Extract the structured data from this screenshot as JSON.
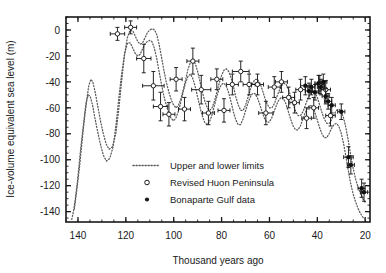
{
  "chart_data": {
    "type": "scatter",
    "title": "",
    "xlabel": "Thousand years ago",
    "ylabel": "Ice-volume equivalent sea level (m)",
    "xlim": [
      145,
      18
    ],
    "ylim": [
      -148,
      10
    ],
    "x_ticks": [
      140,
      120,
      100,
      80,
      60,
      40,
      20
    ],
    "x_tick_labels": [
      "140",
      "120",
      "100",
      "80",
      "60",
      "40",
      "20"
    ],
    "x_minor_step": 5,
    "y_ticks": [
      0,
      -20,
      -40,
      -60,
      -80,
      -100,
      -120,
      -140
    ],
    "y_tick_labels": [
      "0",
      "-20",
      "-40",
      "-60",
      "-80",
      "-100",
      "-120",
      "-140"
    ],
    "y_minor_step": 5,
    "grid": false,
    "axis_direction": "x-reversed",
    "legend_position": "lower-center",
    "legend": [
      {
        "marker": "dotted-line",
        "label": "Upper and lower limits"
      },
      {
        "marker": "open-circle",
        "label": "Revised Huon Peninsula"
      },
      {
        "marker": "filled-circle",
        "label": "Bonaparte Gulf data"
      }
    ],
    "series": [
      {
        "name": "Upper and lower limits",
        "style": "dotted-line",
        "sublines": [
          {
            "name": "upper limit",
            "x": [
              141.5,
              140.8,
              140.0,
              139.2,
              138.5,
              137.8,
              137.0,
              136.2,
              135.5,
              134.6,
              133.8,
              132.8,
              131.8,
              130.6,
              129.4,
              128.2,
              127.0,
              125.6,
              124.2,
              123.0,
              121.8,
              120.6,
              119.4,
              118.2,
              117.0,
              116.0,
              115.0,
              114.0,
              113.0,
              112.0,
              111.0,
              110.0,
              109.0,
              108.0,
              107.0,
              106.0,
              105.0,
              104.0,
              103.0,
              102.0,
              101.0,
              100.0,
              99.0,
              98.0,
              97.0,
              96.0,
              95.0,
              94.0,
              93.0,
              92.0,
              91.0,
              90.0,
              89.0,
              88.0,
              87.0,
              86.0,
              85.0,
              84.0,
              83.0,
              82.0,
              81.0,
              80.0,
              79.0,
              78.0,
              77.0,
              76.0,
              75.0,
              74.0,
              73.0,
              72.0,
              71.0,
              70.0,
              69.0,
              68.0,
              67.0,
              66.0,
              65.0,
              64.0,
              63.0,
              62.0,
              61.0,
              60.0,
              59.0,
              58.0,
              57.0,
              56.0,
              55.0,
              54.0,
              53.0,
              52.0,
              51.0,
              50.0,
              49.0,
              48.0,
              47.0,
              46.0,
              45.0,
              44.0,
              43.0,
              42.0,
              41.0,
              40.0,
              39.0,
              38.0,
              37.0,
              36.0,
              35.0,
              34.0,
              33.0,
              32.0,
              31.0,
              30.0,
              29.0,
              28.0,
              27.0,
              26.0,
              25.0,
              24.0,
              23.0,
              22.0,
              21.0,
              20.0
            ],
            "y": [
              -138,
              -128,
              -116,
              -103,
              -90,
              -77,
              -64,
              -52,
              -43,
              -38,
              -40,
              -48,
              -58,
              -70,
              -80,
              -88,
              -92,
              -90,
              -80,
              -62,
              -40,
              -20,
              -6,
              0,
              -1,
              -5,
              -9,
              -11,
              -10,
              -6,
              -2,
              0,
              1,
              0,
              -4,
              -12,
              -22,
              -32,
              -41,
              -48,
              -54,
              -58,
              -60,
              -58,
              -53,
              -46,
              -38,
              -30,
              -25,
              -23,
              -26,
              -32,
              -40,
              -48,
              -55,
              -60,
              -62,
              -60,
              -55,
              -48,
              -41,
              -35,
              -31,
              -30,
              -32,
              -37,
              -44,
              -52,
              -58,
              -62,
              -62,
              -58,
              -52,
              -46,
              -41,
              -38,
              -38,
              -41,
              -46,
              -52,
              -57,
              -60,
              -60,
              -57,
              -52,
              -47,
              -43,
              -41,
              -42,
              -46,
              -52,
              -58,
              -63,
              -66,
              -66,
              -63,
              -58,
              -53,
              -49,
              -47,
              -48,
              -52,
              -58,
              -64,
              -69,
              -72,
              -72,
              -69,
              -65,
              -62,
              -61,
              -63,
              -68,
              -76,
              -86,
              -97,
              -107,
              -115,
              -121,
              -126,
              -130,
              -133,
              -135
            ]
          },
          {
            "name": "lower limit",
            "x": [
              142.6,
              141.9,
              141.1,
              140.3,
              139.6,
              138.9,
              138.1,
              137.3,
              136.6,
              135.7,
              134.9,
              133.9,
              132.9,
              131.7,
              130.5,
              129.3,
              128.1,
              126.7,
              125.3,
              124.1,
              122.9,
              121.7,
              120.5,
              119.3,
              118.1,
              117.1,
              116.1,
              115.1,
              114.1,
              113.1,
              112.1,
              111.1,
              110.1,
              109.1,
              108.1,
              107.1,
              106.1,
              105.1,
              104.1,
              103.1,
              102.1,
              101.1,
              100.1,
              99.1,
              98.1,
              97.1,
              96.1,
              95.1,
              94.1,
              93.1,
              92.1,
              91.1,
              90.1,
              89.1,
              88.1,
              87.1,
              86.1,
              85.1,
              84.1,
              83.1,
              82.1,
              81.1,
              80.1,
              79.1,
              78.1,
              77.1,
              76.1,
              75.1,
              74.1,
              73.1,
              72.1,
              71.1,
              70.1,
              69.1,
              68.1,
              67.1,
              66.1,
              65.1,
              64.1,
              63.1,
              62.1,
              61.1,
              60.1,
              59.1,
              58.1,
              57.1,
              56.1,
              55.1,
              54.1,
              53.1,
              52.1,
              51.1,
              50.1,
              49.1,
              48.1,
              47.1,
              46.1,
              45.1,
              44.1,
              43.1,
              42.1,
              41.1,
              40.1,
              39.1,
              38.1,
              37.1,
              36.1,
              35.1,
              34.1,
              33.1,
              32.1,
              31.1,
              30.1,
              29.1,
              28.1,
              27.1,
              26.1,
              25.1,
              24.1,
              23.1,
              22.1,
              21.1,
              20.1
            ],
            "y": [
              -146,
              -140,
              -130,
              -118,
              -105,
              -92,
              -79,
              -66,
              -56,
              -50,
              -51,
              -58,
              -68,
              -79,
              -89,
              -97,
              -101,
              -99,
              -90,
              -73,
              -52,
              -33,
              -18,
              -10,
              -10,
              -14,
              -18,
              -20,
              -19,
              -15,
              -11,
              -9,
              -8,
              -9,
              -14,
              -22,
              -32,
              -42,
              -51,
              -58,
              -64,
              -68,
              -70,
              -68,
              -63,
              -56,
              -48,
              -41,
              -36,
              -34,
              -37,
              -43,
              -51,
              -59,
              -66,
              -71,
              -73,
              -71,
              -66,
              -59,
              -52,
              -46,
              -42,
              -41,
              -43,
              -48,
              -55,
              -63,
              -69,
              -73,
              -73,
              -69,
              -63,
              -57,
              -52,
              -49,
              -49,
              -52,
              -57,
              -63,
              -68,
              -71,
              -71,
              -68,
              -63,
              -58,
              -54,
              -52,
              -53,
              -57,
              -63,
              -69,
              -74,
              -77,
              -77,
              -74,
              -69,
              -64,
              -60,
              -58,
              -59,
              -63,
              -69,
              -75,
              -80,
              -83,
              -83,
              -80,
              -76,
              -73,
              -72,
              -74,
              -79,
              -87,
              -97,
              -108,
              -118,
              -126,
              -132,
              -137,
              -141,
              -144,
              -146
            ]
          }
        ]
      },
      {
        "name": "Revised Huon Peninsula",
        "style": "open-circle",
        "points": [
          {
            "x": 123.5,
            "y": -3,
            "xerr": 3.0,
            "yerr": 5
          },
          {
            "x": 118.0,
            "y": 2,
            "xerr": 2.5,
            "yerr": 5
          },
          {
            "x": 112.5,
            "y": -22,
            "xerr": 3.0,
            "yerr": 11
          },
          {
            "x": 108.5,
            "y": -43,
            "xerr": 4.5,
            "yerr": 11
          },
          {
            "x": 105.5,
            "y": -59,
            "xerr": 3.0,
            "yerr": 11
          },
          {
            "x": 102.0,
            "y": -65,
            "xerr": 2.5,
            "yerr": 9
          },
          {
            "x": 99.0,
            "y": -38,
            "xerr": 2.5,
            "yerr": 9
          },
          {
            "x": 95.5,
            "y": -61,
            "xerr": 2.5,
            "yerr": 9
          },
          {
            "x": 92.0,
            "y": -24,
            "xerr": 2.5,
            "yerr": 10
          },
          {
            "x": 88.5,
            "y": -46,
            "xerr": 4.0,
            "yerr": 11
          },
          {
            "x": 85.5,
            "y": -64,
            "xerr": 2.5,
            "yerr": 9
          },
          {
            "x": 82.0,
            "y": -38,
            "xerr": 2.5,
            "yerr": 8
          },
          {
            "x": 79.0,
            "y": -62,
            "xerr": 2.5,
            "yerr": 9
          },
          {
            "x": 75.5,
            "y": -42,
            "xerr": 2.5,
            "yerr": 8
          },
          {
            "x": 72.0,
            "y": -32,
            "xerr": 3.5,
            "yerr": 8
          },
          {
            "x": 68.5,
            "y": -42,
            "xerr": 2.5,
            "yerr": 8
          },
          {
            "x": 65.0,
            "y": -42,
            "xerr": 2.5,
            "yerr": 8
          },
          {
            "x": 61.5,
            "y": -64,
            "xerr": 3.0,
            "yerr": 9
          },
          {
            "x": 58.0,
            "y": -44,
            "xerr": 2.5,
            "yerr": 8
          },
          {
            "x": 55.0,
            "y": -40,
            "xerr": 2.5,
            "yerr": 8
          },
          {
            "x": 52.0,
            "y": -52,
            "xerr": 2.5,
            "yerr": 8
          },
          {
            "x": 49.5,
            "y": -56,
            "xerr": 2.0,
            "yerr": 8
          },
          {
            "x": 47.0,
            "y": -46,
            "xerr": 2.0,
            "yerr": 8
          },
          {
            "x": 44.5,
            "y": -68,
            "xerr": 2.0,
            "yerr": 8
          },
          {
            "x": 41.5,
            "y": -60,
            "xerr": 2.0,
            "yerr": 8
          },
          {
            "x": 39.0,
            "y": -42,
            "xerr": 2.0,
            "yerr": 7
          },
          {
            "x": 36.5,
            "y": -46,
            "xerr": 2.0,
            "yerr": 7
          },
          {
            "x": 34.5,
            "y": -66,
            "xerr": 2.0,
            "yerr": 8
          }
        ]
      },
      {
        "name": "Bonaparte Gulf data",
        "style": "filled-circle",
        "points": [
          {
            "x": 45.0,
            "y": -43,
            "xerr": 2.0,
            "yerr": 7
          },
          {
            "x": 43.5,
            "y": -47,
            "xerr": 1.5,
            "yerr": 6
          },
          {
            "x": 42.5,
            "y": -44,
            "xerr": 1.5,
            "yerr": 6
          },
          {
            "x": 41.0,
            "y": -48,
            "xerr": 1.5,
            "yerr": 6
          },
          {
            "x": 39.5,
            "y": -41,
            "xerr": 1.5,
            "yerr": 6
          },
          {
            "x": 38.5,
            "y": -44,
            "xerr": 1.5,
            "yerr": 6
          },
          {
            "x": 37.5,
            "y": -40,
            "xerr": 1.5,
            "yerr": 6
          },
          {
            "x": 36.5,
            "y": -51,
            "xerr": 1.5,
            "yerr": 6
          },
          {
            "x": 35.5,
            "y": -55,
            "xerr": 1.5,
            "yerr": 6
          },
          {
            "x": 34.0,
            "y": -58,
            "xerr": 1.5,
            "yerr": 6
          },
          {
            "x": 30.0,
            "y": -63,
            "xerr": 1.5,
            "yerr": 6
          },
          {
            "x": 27.0,
            "y": -98,
            "xerr": 2.0,
            "yerr": 8
          },
          {
            "x": 26.0,
            "y": -104,
            "xerr": 1.5,
            "yerr": 7
          },
          {
            "x": 21.5,
            "y": -122,
            "xerr": 1.5,
            "yerr": 7
          },
          {
            "x": 20.5,
            "y": -125,
            "xerr": 1.5,
            "yerr": 7
          }
        ]
      }
    ]
  },
  "axes": {
    "y_label": "Ice-volume equivalent sea level (m)",
    "x_label": "Thousand years ago"
  },
  "legend_items": {
    "limits": "Upper and lower limits",
    "huon": "Revised Huon Peninsula",
    "bonaparte": "Bonaparte Gulf data"
  },
  "colors": {
    "axis": "#1a1a1a",
    "line": "#555555",
    "marker": "#1a1a1a",
    "background": "#ffffff"
  }
}
